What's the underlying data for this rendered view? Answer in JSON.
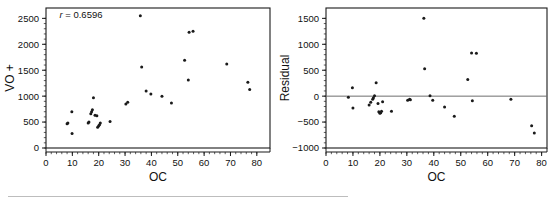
{
  "figure": {
    "background_color": "#ffffff",
    "point_color": "#1a1a1a",
    "axis_color": "#1a1a1a",
    "zero_line_color": "#6e6e6e"
  },
  "chart_data": [
    {
      "type": "scatter",
      "panel": "left",
      "title": "",
      "xlabel": "OC",
      "ylabel": "VO +",
      "xlim": [
        0,
        85
      ],
      "ylim": [
        0,
        2700
      ],
      "xticks": [
        0,
        10,
        20,
        30,
        40,
        50,
        60,
        70,
        80
      ],
      "yticks": [
        0,
        500,
        1000,
        1500,
        2000,
        2500
      ],
      "grid": false,
      "legend": "none",
      "annotations": [
        {
          "text_italic": "r",
          "text": " = 0.6596",
          "x": 0.06,
          "y": 0.93
        }
      ],
      "x": [
        8.0,
        8.3,
        9.8,
        9.9,
        16.0,
        16.3,
        17.0,
        17.3,
        17.6,
        18.0,
        18.6,
        19.3,
        19.6,
        20.0,
        20.3,
        20.6,
        24.3,
        30.3,
        31.0,
        35.8,
        36.3,
        38.0,
        39.8,
        44.0,
        47.6,
        52.6,
        54.0,
        54.3,
        55.8,
        68.6,
        76.6,
        77.3
      ],
      "y": [
        470,
        480,
        700,
        280,
        480,
        500,
        660,
        700,
        740,
        970,
        630,
        620,
        400,
        430,
        450,
        480,
        510,
        850,
        880,
        2550,
        1560,
        1100,
        1040,
        1000,
        870,
        1690,
        1310,
        2230,
        2250,
        1620,
        1270,
        1130
      ]
    },
    {
      "type": "scatter",
      "panel": "right",
      "title": "",
      "xlabel": "OC",
      "ylabel": "Residual",
      "xlim": [
        0,
        82
      ],
      "ylim": [
        -1000,
        1700
      ],
      "xticks": [
        0,
        10,
        20,
        30,
        40,
        50,
        60,
        70,
        80
      ],
      "yticks": [
        -1000,
        -500,
        0,
        500,
        1000,
        1500
      ],
      "grid": false,
      "legend": "none",
      "reference_line_y": 0,
      "x": [
        8.3,
        9.8,
        10.0,
        16.0,
        16.6,
        17.3,
        17.6,
        18.0,
        18.6,
        19.3,
        19.6,
        20.0,
        20.3,
        20.6,
        21.0,
        24.3,
        30.3,
        31.0,
        31.3,
        36.3,
        36.6,
        38.6,
        39.6,
        44.0,
        47.6,
        52.6,
        54.0,
        54.3,
        55.8,
        68.6,
        76.3,
        77.3
      ],
      "y": [
        -20,
        160,
        -230,
        -170,
        -120,
        -60,
        -30,
        10,
        260,
        -140,
        -300,
        -330,
        -320,
        -290,
        -110,
        -290,
        -80,
        -60,
        -70,
        1500,
        530,
        10,
        -80,
        -210,
        -390,
        320,
        830,
        -90,
        825,
        -60,
        -570,
        -710
      ]
    }
  ],
  "left_panel": {
    "xlabel": "OC",
    "ylabel": "VO +",
    "xticklabels": [
      "0",
      "10",
      "20",
      "30",
      "40",
      "50",
      "60",
      "70",
      "80"
    ],
    "yticklabels": [
      "0",
      "500",
      "1000",
      "1500",
      "2000",
      "2500"
    ],
    "correlation_prefix": "r",
    "correlation_text": " = 0.6596"
  },
  "right_panel": {
    "xlabel": "OC",
    "ylabel": "Residual",
    "xticklabels": [
      "0",
      "10",
      "20",
      "30",
      "40",
      "50",
      "60",
      "70",
      "80"
    ],
    "yticklabels": [
      "−1000",
      "−500",
      "0",
      "500",
      "1000",
      "1500"
    ]
  }
}
